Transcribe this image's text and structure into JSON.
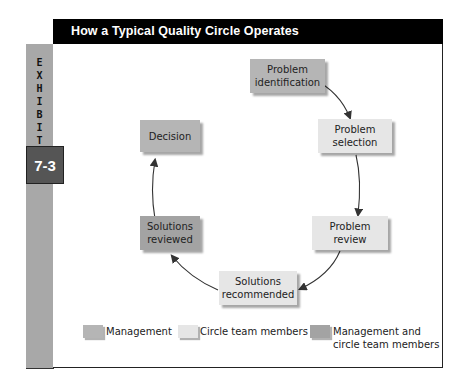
{
  "title": "How a Typical Quality Circle Operates",
  "exhibit": {
    "label": "EXHIBIT",
    "letters": [
      "E",
      "X",
      "H",
      "I",
      "B",
      "I",
      "T"
    ],
    "number": "7-3"
  },
  "colors": {
    "management": "#b5b5b5",
    "circle_team": "#e6e6e6",
    "both": "#a3a3a3",
    "title_bg": "#000000",
    "exhibit_strip": "#a8a8a8",
    "exhibit_number_bg": "#555555"
  },
  "steps": [
    {
      "id": "problem-identification",
      "line1": "Problem",
      "line2": "identification",
      "role": "management"
    },
    {
      "id": "problem-selection",
      "line1": "Problem",
      "line2": "selection",
      "role": "circle_team"
    },
    {
      "id": "problem-review",
      "line1": "Problem",
      "line2": "review",
      "role": "circle_team"
    },
    {
      "id": "solutions-recommended",
      "line1": "Solutions",
      "line2": "recommended",
      "role": "circle_team"
    },
    {
      "id": "solutions-reviewed",
      "line1": "Solutions",
      "line2": "reviewed",
      "role": "both"
    },
    {
      "id": "decision",
      "line1": "Decision",
      "line2": "",
      "role": "management"
    }
  ],
  "legend": [
    {
      "label": "Management",
      "role": "management"
    },
    {
      "label": "Circle team members",
      "role": "circle_team"
    },
    {
      "label_line1": "Management and",
      "label_line2": "circle team members",
      "role": "both"
    }
  ]
}
